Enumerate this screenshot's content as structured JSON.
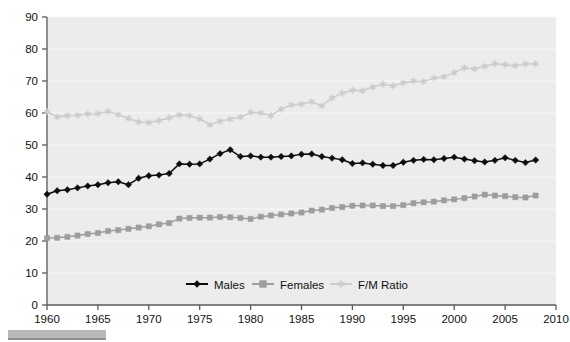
{
  "chart_data": {
    "type": "line",
    "title": "",
    "xlabel": "",
    "ylabel": "",
    "xlim": [
      1960,
      2010
    ],
    "ylim": [
      0,
      90
    ],
    "grid": true,
    "legend_position": "bottom-center",
    "y_ticks": [
      0,
      10,
      20,
      30,
      40,
      50,
      60,
      70,
      80,
      90
    ],
    "x_ticks": [
      1960,
      1965,
      1970,
      1975,
      1980,
      1985,
      1990,
      1995,
      2000,
      2005,
      2010
    ],
    "x": [
      1960,
      1961,
      1962,
      1963,
      1964,
      1965,
      1966,
      1967,
      1968,
      1969,
      1970,
      1971,
      1972,
      1973,
      1974,
      1975,
      1976,
      1977,
      1978,
      1979,
      1980,
      1981,
      1982,
      1983,
      1984,
      1985,
      1986,
      1987,
      1988,
      1989,
      1990,
      1991,
      1992,
      1993,
      1994,
      1995,
      1996,
      1997,
      1998,
      1999,
      2000,
      2001,
      2002,
      2003,
      2004,
      2005,
      2006,
      2007,
      2008
    ],
    "series": [
      {
        "name": "Males",
        "color": "#0d0d0d",
        "marker": "diamond",
        "values": [
          34.6,
          35.7,
          36.0,
          36.6,
          37.2,
          37.6,
          38.2,
          38.5,
          37.6,
          39.6,
          40.4,
          40.6,
          41.1,
          44.1,
          44.0,
          44.1,
          45.6,
          47.3,
          48.5,
          46.4,
          46.6,
          46.2,
          46.2,
          46.4,
          46.6,
          47.1,
          47.2,
          46.4,
          45.9,
          45.4,
          44.2,
          44.4,
          44.0,
          43.6,
          43.6,
          44.6,
          45.2,
          45.5,
          45.4,
          45.8,
          46.2,
          45.6,
          45.1,
          44.7,
          45.2,
          46.0,
          45.2,
          44.5,
          45.3
        ]
      },
      {
        "name": "Females",
        "color": "#9d9d9d",
        "marker": "square",
        "values": [
          20.9,
          21.0,
          21.3,
          21.7,
          22.2,
          22.5,
          23.1,
          23.4,
          23.8,
          24.2,
          24.6,
          25.2,
          25.6,
          27.0,
          27.2,
          27.3,
          27.3,
          27.5,
          27.4,
          27.2,
          26.9,
          27.6,
          28.0,
          28.3,
          28.6,
          28.9,
          29.5,
          29.8,
          30.3,
          30.6,
          31.0,
          31.1,
          31.1,
          30.9,
          30.9,
          31.2,
          31.8,
          32.1,
          32.3,
          32.7,
          33.0,
          33.4,
          33.9,
          34.5,
          34.2,
          34.0,
          33.7,
          33.6,
          34.2
        ]
      },
      {
        "name": "F/M Ratio",
        "color": "#cccccc",
        "marker": "star",
        "values": [
          60.4,
          58.8,
          59.2,
          59.3,
          59.7,
          59.8,
          60.5,
          59.5,
          58.3,
          57.2,
          57.0,
          57.6,
          58.5,
          59.4,
          59.2,
          58.2,
          56.3,
          57.4,
          58.1,
          58.7,
          60.2,
          60.0,
          59.2,
          61.2,
          62.5,
          62.8,
          63.5,
          62.2,
          64.7,
          66.2,
          67.1,
          67.0,
          68.1,
          69.0,
          68.5,
          69.4,
          70.0,
          69.8,
          70.9,
          71.3,
          72.6,
          74.1,
          73.8,
          74.6,
          75.4,
          75.1,
          74.8,
          75.3,
          75.4
        ]
      }
    ]
  },
  "legend": {
    "entries": [
      {
        "label": "Males"
      },
      {
        "label": "Females"
      },
      {
        "label": "F/M Ratio"
      }
    ]
  },
  "axes": {
    "y_tick_labels": [
      "0",
      "10",
      "20",
      "30",
      "40",
      "50",
      "60",
      "70",
      "80",
      "90"
    ],
    "x_tick_labels": [
      "1960",
      "1965",
      "1970",
      "1975",
      "1980",
      "1985",
      "1990",
      "1995",
      "2000",
      "2005",
      "2010"
    ]
  },
  "colors": {
    "plot_background": "#ececec",
    "gridline": "#f8f8f8",
    "axis": "#5a5a5a",
    "males": "#0d0d0d",
    "females": "#9d9d9d",
    "ratio": "#cccccc",
    "caption_strip": "#b9b9b9"
  }
}
